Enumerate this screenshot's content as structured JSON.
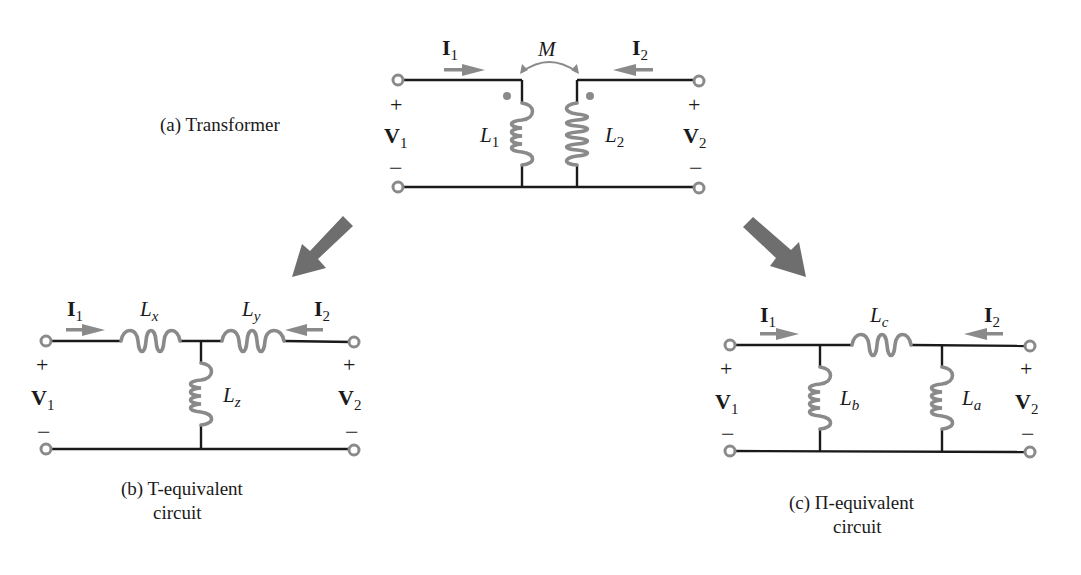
{
  "figure": {
    "transformer": {
      "caption": "(a)  Transformer",
      "current_1": {
        "sym": "I",
        "sub": "1"
      },
      "current_2": {
        "sym": "I",
        "sub": "2"
      },
      "voltage_1": {
        "sym": "V",
        "sub": "1"
      },
      "voltage_2": {
        "sym": "V",
        "sub": "2"
      },
      "mutual": "M",
      "inductor_1": {
        "sym": "L",
        "sub": "1"
      },
      "inductor_2": {
        "sym": "L",
        "sub": "2"
      },
      "plus": "+",
      "minus": "−"
    },
    "t_equivalent": {
      "caption_line1": "(b)  T-equivalent",
      "caption_line2": "circuit",
      "current_1": {
        "sym": "I",
        "sub": "1"
      },
      "current_2": {
        "sym": "I",
        "sub": "2"
      },
      "voltage_1": {
        "sym": "V",
        "sub": "1"
      },
      "voltage_2": {
        "sym": "V",
        "sub": "2"
      },
      "inductor_x": {
        "sym": "L",
        "sub": "x"
      },
      "inductor_y": {
        "sym": "L",
        "sub": "y"
      },
      "inductor_z": {
        "sym": "L",
        "sub": "z"
      },
      "plus": "+",
      "minus": "−"
    },
    "pi_equivalent": {
      "caption_line1": "(c)  Π-equivalent",
      "caption_line2": "circuit",
      "current_1": {
        "sym": "I",
        "sub": "1"
      },
      "current_2": {
        "sym": "I",
        "sub": "2"
      },
      "voltage_1": {
        "sym": "V",
        "sub": "1"
      },
      "voltage_2": {
        "sym": "V",
        "sub": "2"
      },
      "inductor_a": {
        "sym": "L",
        "sub": "a"
      },
      "inductor_b": {
        "sym": "L",
        "sub": "b"
      },
      "inductor_c": {
        "sym": "L",
        "sub": "c"
      },
      "plus": "+",
      "minus": "−"
    },
    "colors": {
      "wire": "#1a1a1a",
      "component": "#8a8a8a",
      "arrow": "#6e6e6e"
    }
  }
}
